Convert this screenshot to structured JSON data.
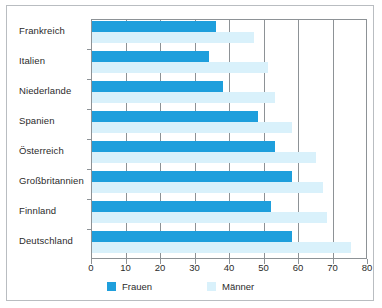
{
  "chart_data": {
    "type": "bar",
    "orientation": "horizontal",
    "title": "",
    "subtitle": "",
    "xlabel": "",
    "ylabel": "",
    "xlim": [
      0,
      80
    ],
    "xticks": [
      0,
      10,
      20,
      30,
      40,
      50,
      60,
      70,
      80
    ],
    "xtick_labels": [
      "0",
      "10",
      "20",
      "30",
      "40",
      "50",
      "60",
      "70",
      "80"
    ],
    "grid": true,
    "grid_axis": "x",
    "legend_position": "bottom",
    "categories": [
      "Frankreich",
      "Italien",
      "Niederlande",
      "Spanien",
      "Österreich",
      "Großbritannien",
      "Finnland",
      "Deutschland"
    ],
    "series": [
      {
        "name": "Frauen",
        "color": "#1f9fdc",
        "values": [
          36,
          34,
          38,
          48,
          53,
          58,
          52,
          58
        ]
      },
      {
        "name": "Männer",
        "color": "#d9f1fb",
        "values": [
          47,
          51,
          53,
          58,
          65,
          67,
          68,
          75
        ]
      }
    ]
  },
  "colors": {
    "frauen": "#1f9fdc",
    "maenner": "#d9f1fb",
    "axis": "#8d9296",
    "frame": "#b9bdc1",
    "text": "#2b2b2b",
    "background": "#ffffff"
  },
  "legend": {
    "items": [
      {
        "label": "Frauen",
        "color": "#1f9fdc"
      },
      {
        "label": "Männer",
        "color": "#d9f1fb"
      }
    ]
  }
}
